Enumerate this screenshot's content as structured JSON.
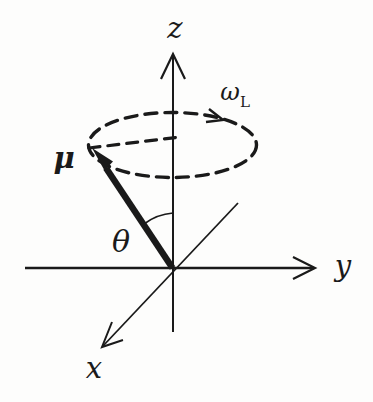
{
  "colors": {
    "ink": "#1a1a1a",
    "background": "#fdfdfc"
  },
  "diagram": {
    "axis_labels": {
      "z": "z",
      "y": "y",
      "x": "x"
    },
    "vector_label": "μ",
    "angle_label": "θ",
    "precession_frequency": {
      "symbol": "ω",
      "subscript": "L"
    }
  }
}
